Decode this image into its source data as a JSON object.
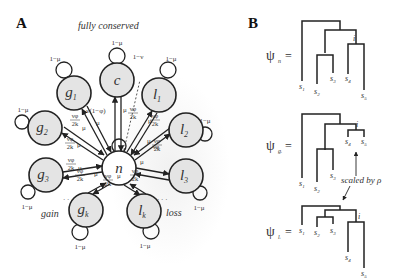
{
  "panel_a": {
    "label": "A",
    "title": "fully conserved",
    "region_gain": "gain",
    "region_loss": "loss",
    "center_node": "n",
    "conserved_node": "c",
    "gain_nodes": [
      {
        "base": "g",
        "sub": "1"
      },
      {
        "base": "g",
        "sub": "2"
      },
      {
        "base": "g",
        "sub": "3"
      },
      {
        "base": "g",
        "sub": "k"
      }
    ],
    "loss_nodes": [
      {
        "base": "l",
        "sub": "1"
      },
      {
        "base": "l",
        "sub": "2"
      },
      {
        "base": "l",
        "sub": "3"
      },
      {
        "base": "l",
        "sub": "k"
      }
    ],
    "edge_labels": {
      "self_loop": "1−μ",
      "return": "μ",
      "to_conserved": "ν(1−φ)",
      "n_self": "1−ν",
      "frac_num": "νφ",
      "frac_den": "2k"
    },
    "ellipsis": "· · ·"
  },
  "panel_b": {
    "label": "B",
    "trees": [
      {
        "psi": "ψ",
        "sub": "n",
        "eq": "="
      },
      {
        "psi": "ψ",
        "sub": "gᵢ",
        "eq": "="
      },
      {
        "psi": "ψ",
        "sub": "lᵢ",
        "eq": "="
      }
    ],
    "leaves": [
      "s1",
      "s2",
      "s3",
      "s4",
      "s5"
    ],
    "leaf_base": "s",
    "leaf_subs": [
      "1",
      "2",
      "3",
      "4",
      "5"
    ],
    "internal_node": "i",
    "annotation": "scaled by ρ"
  }
}
